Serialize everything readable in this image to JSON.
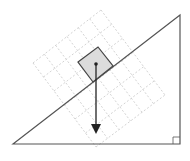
{
  "diagram": {
    "type": "inclined-plane-free-body",
    "colors": {
      "background": "#ffffff",
      "incline_stroke": "#555555",
      "grid_stroke": "#c8c8c8",
      "block_fill": "#dcdcdc",
      "block_stroke": "#444444",
      "arrow": "#222222"
    },
    "incline": {
      "points": [
        [
          13,
          144
        ],
        [
          180,
          15
        ],
        [
          180,
          144
        ]
      ],
      "right_angle_marker": {
        "x": 173,
        "y": 137,
        "size": 7
      }
    },
    "grid": {
      "corners": [
        [
          33,
          63
        ],
        [
          101,
          10
        ],
        [
          165,
          95
        ],
        [
          96,
          147
        ]
      ],
      "rows": 6,
      "cols": 6
    },
    "block": {
      "corners": [
        [
          78,
          62
        ],
        [
          98,
          47
        ],
        [
          113,
          66
        ],
        [
          93,
          82
        ]
      ],
      "center": [
        96,
        64
      ]
    },
    "weight_vector": {
      "from": [
        96,
        64
      ],
      "to": [
        96,
        134
      ],
      "head_length": 10,
      "head_width": 10
    }
  }
}
